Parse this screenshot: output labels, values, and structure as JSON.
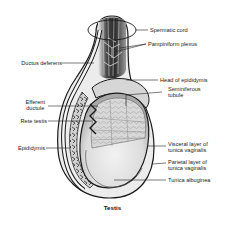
{
  "figure": {
    "caption": "Testis",
    "labels": {
      "spermatic_cord": "Spermatic cord",
      "pampiniform_plexus": "Pampiniform plexus",
      "ductus_deferens": "Ductus deferens",
      "head_of_epididymis": "Head of epididymis",
      "seminiferous_tubule_line1": "Seminiferous",
      "seminiferous_tubule_line2": "tubule",
      "efferent_ductule_line1": "Efferent",
      "efferent_ductule_line2": "ductule",
      "rete_testis": "Rete testis",
      "epididymis": "Epididymis",
      "visceral_layer_line1": "Visceral layer of",
      "visceral_layer_line2": "tunica vaginalis",
      "parietal_layer_line1": "Parietal layer of",
      "parietal_layer_line2": "tunica vaginalis",
      "tunica_albuginea": "Tunica albuginea"
    },
    "colors": {
      "background": "#ffffff",
      "outline": "#1a1a1a",
      "testis_fill": "#e6e6e6",
      "tubule_fill": "#cfcfcf",
      "cord_dark": "#3a3a3a",
      "leader_line": "#222222"
    }
  }
}
